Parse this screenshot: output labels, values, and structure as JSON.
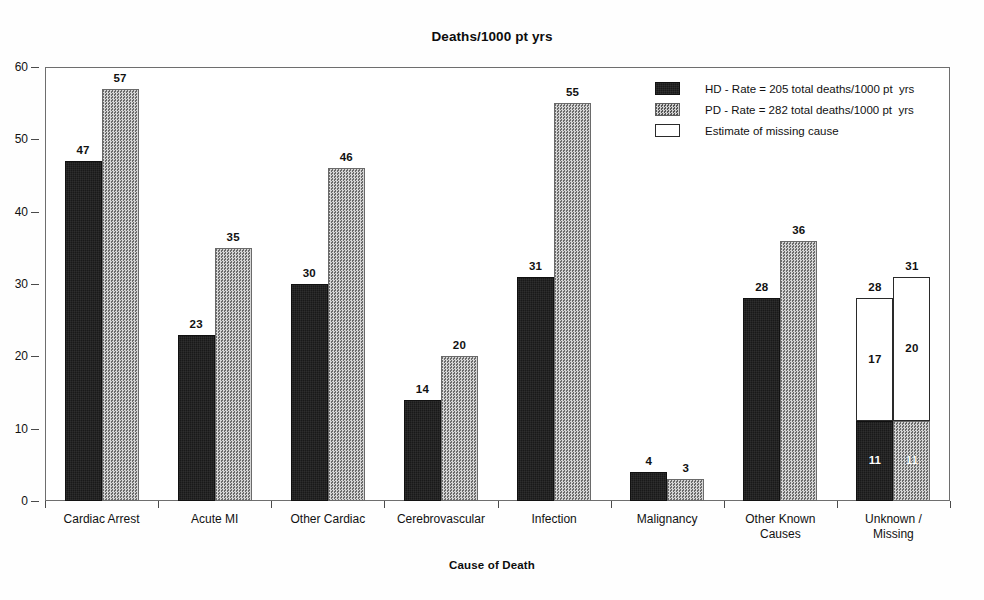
{
  "chart_data": {
    "type": "bar",
    "title": "Deaths/1000 pt yrs",
    "xlabel": "Cause of Death",
    "ylabel": "",
    "ylim": [
      0,
      60
    ],
    "ytick_labels": [
      "60",
      "50",
      "40",
      "30",
      "20",
      "10",
      "0"
    ],
    "ytick_values": [
      60,
      50,
      40,
      30,
      20,
      10,
      0
    ],
    "grid": false,
    "legend_position": "top-right",
    "categories": [
      "Cardiac Arrest",
      "Acute MI",
      "Other Cardiac",
      "Cerebrovascular",
      "Infection",
      "Malignancy",
      "Other Known\nCauses",
      "Unknown / Missing"
    ],
    "series": [
      {
        "name": "HD - Rate = 205 total deaths/1000 pt  yrs",
        "key": "hd",
        "color": "#191919",
        "values": [
          47,
          23,
          30,
          14,
          31,
          4,
          28,
          11
        ],
        "labels": [
          "47",
          "23",
          "30",
          "14",
          "31",
          "4",
          "28",
          "11"
        ]
      },
      {
        "name": "PD - Rate = 282 total deaths/1000 pt  yrs",
        "key": "pd",
        "color": "#9a9a9a",
        "values": [
          57,
          35,
          46,
          20,
          55,
          3,
          36,
          11
        ],
        "labels": [
          "57",
          "35",
          "46",
          "20",
          "55",
          "3",
          "36",
          "11"
        ]
      },
      {
        "name": "Estimate of missing cause",
        "key": "est",
        "color": "#ffffff",
        "values": [
          0,
          0,
          0,
          0,
          0,
          0,
          0,
          0
        ],
        "stacked_on": {
          "hd": {
            "category": "Unknown / Missing",
            "segment_value": 17,
            "segment_label": "17",
            "total": 28,
            "total_label": "28"
          },
          "pd": {
            "category": "Unknown / Missing",
            "segment_value": 20,
            "segment_label": "20",
            "total": 31,
            "total_label": "31"
          }
        }
      }
    ],
    "annotations": [
      "Unknown / Missing HD bar: 11 known + 17 estimated missing = 28 total",
      "Unknown / Missing PD bar: 11 known + 20 estimated missing = 31 total"
    ]
  },
  "legend": {
    "entries": [
      {
        "swatch": "hd",
        "label": "HD - Rate = 205 total deaths/1000 pt  yrs"
      },
      {
        "swatch": "pd",
        "label": "PD - Rate = 282 total deaths/1000 pt  yrs"
      },
      {
        "swatch": "est",
        "label": "Estimate of missing cause"
      }
    ]
  },
  "colors": {
    "hd_bar": "#191919",
    "pd_bar": "#9a9a9a",
    "estimate_bar": "#ffffff",
    "axis": "#4a4a4a",
    "frame": "#6e6e6e",
    "text": "#111111",
    "background": "#ffffff"
  }
}
